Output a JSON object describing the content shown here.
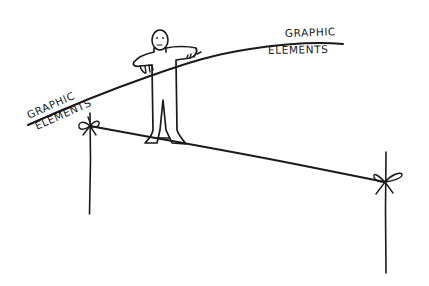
{
  "illustration": {
    "description": "Hand-drawn cartoon of a tightrope walker balancing with a long pole; the pole is labeled at both ends",
    "colors": {
      "background": "#ffffff",
      "ink": "#1a1a1a"
    },
    "labels": {
      "left_top": "GRAPHIC",
      "left_bottom": "ELEMENTS",
      "right_top": "GRAPHIC",
      "right_bottom": "ELEMENTS"
    }
  }
}
